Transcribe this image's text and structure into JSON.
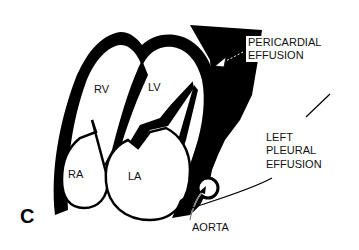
{
  "figure": {
    "panel_label": "C"
  },
  "chambers": {
    "rv": "RV",
    "lv": "LV",
    "ra": "RA",
    "la": "LA"
  },
  "annotations": {
    "pericardial_line1": "PERICARDIAL",
    "pericardial_line2": "EFFUSION",
    "pleural_line1": "LEFT",
    "pleural_line2": "PLEURAL",
    "pleural_line3": "EFFUSION",
    "aorta": "AORTA"
  },
  "colors": {
    "ink": "#000000",
    "background": "#ffffff"
  }
}
